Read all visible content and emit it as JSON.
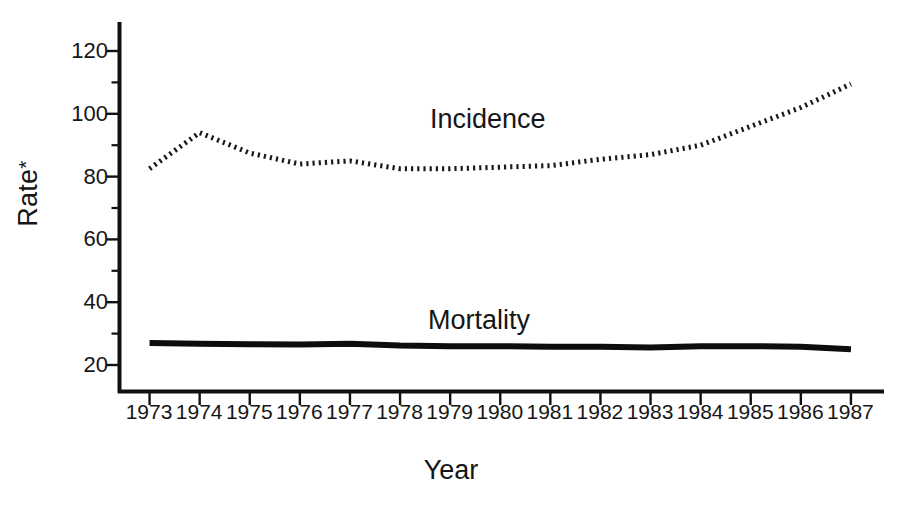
{
  "chart_data": {
    "type": "line",
    "title": "",
    "subtitle": "",
    "xlabel": "Year",
    "ylabel": "Rate*",
    "ylabel_text": "Rate",
    "ylabel_footnote_marker": "*",
    "grid": false,
    "legend_position": "inline-annotation",
    "xlim": [
      1972.4,
      1987.6
    ],
    "ylim": [
      8.5,
      128
    ],
    "yticks_major": [
      20,
      40,
      60,
      80,
      100,
      120
    ],
    "yticks_minor": [
      30,
      50,
      70,
      90,
      110
    ],
    "x": [
      1973,
      1974,
      1975,
      1976,
      1977,
      1978,
      1979,
      1980,
      1981,
      1982,
      1983,
      1984,
      1985,
      1986,
      1987
    ],
    "categories": [
      "1973",
      "1974",
      "1975",
      "1976",
      "1977",
      "1978",
      "1979",
      "1980",
      "1981",
      "1982",
      "1983",
      "1984",
      "1985",
      "1986",
      "1987"
    ],
    "series": [
      {
        "name": "Incidence",
        "label": "Incidence",
        "style": "dotted",
        "color": "#1a1a1a",
        "values": [
          82.5,
          94.0,
          87.5,
          84.0,
          85.0,
          82.5,
          82.5,
          83.0,
          83.5,
          85.5,
          87.0,
          90.0,
          96.0,
          102.0,
          109.5
        ]
      },
      {
        "name": "Mortality",
        "label": "Mortality",
        "style": "solid",
        "color": "#0d0d0d",
        "values": [
          27.0,
          26.8,
          26.6,
          26.5,
          26.8,
          26.2,
          26.0,
          26.0,
          25.8,
          25.8,
          25.6,
          26.0,
          26.0,
          25.8,
          25.0
        ]
      }
    ]
  },
  "axis": {
    "y_title": "Rate",
    "y_title_marker": "*",
    "x_title": "Year"
  }
}
